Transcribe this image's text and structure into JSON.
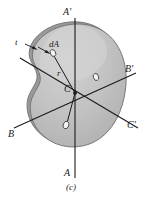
{
  "figure": {
    "caption": "(c)",
    "labels": {
      "axis_a_top": "A'",
      "axis_a_bottom": "A",
      "axis_b_left": "B",
      "axis_b_right": "B'",
      "axis_c_right": "C'",
      "centroid": "C",
      "differential_area": "dA",
      "radius": "r",
      "thickness": "t"
    },
    "colors": {
      "body_fill": "#b9b9b9",
      "highlight_fill": "#cccccc",
      "rim_fill": "#9a9a9a",
      "outline": "#6e6e6e",
      "axis_line": "#1a1a1a",
      "element_fill": "#f2f2f2",
      "background": "#ffffff",
      "text": "#1a1a1a"
    },
    "geometry": {
      "centroid_point": {
        "x": 75,
        "y": 93
      },
      "axis_a_top_point": {
        "x": 75,
        "y": 18
      },
      "axis_a_bottom_point": {
        "x": 75,
        "y": 178
      },
      "axis_b_left_point": {
        "x": 14,
        "y": 128
      },
      "axis_b_right_point": {
        "x": 136,
        "y": 73
      },
      "axis_c_left_point": {
        "x": 20,
        "y": 58
      },
      "axis_c_right_point": {
        "x": 138,
        "y": 128
      },
      "area_elements": [
        {
          "name": "dA-top-left",
          "x": 53,
          "y": 53,
          "rx": 2.6,
          "ry": 3.6,
          "rotate": -25
        },
        {
          "name": "dA-right",
          "x": 96,
          "y": 77,
          "rx": 2.6,
          "ry": 3.6,
          "rotate": -20
        },
        {
          "name": "dA-bottom",
          "x": 66,
          "y": 125,
          "rx": 2.8,
          "ry": 3.8,
          "rotate": 20
        }
      ]
    }
  }
}
